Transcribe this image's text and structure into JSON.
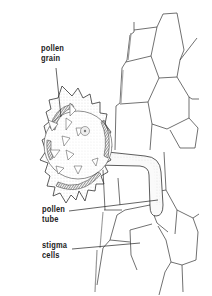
{
  "diagram": {
    "colors": {
      "line": "#333333",
      "shade": "#555555",
      "background": "#ffffff"
    },
    "labels": [
      {
        "id": "pollen-grain",
        "line1": "pollen",
        "line2": "grain"
      },
      {
        "id": "pollen-tube",
        "line1": "pollen",
        "line2": "tube"
      },
      {
        "id": "stigma-cells",
        "line1": "stigma",
        "line2": "cells"
      }
    ]
  }
}
